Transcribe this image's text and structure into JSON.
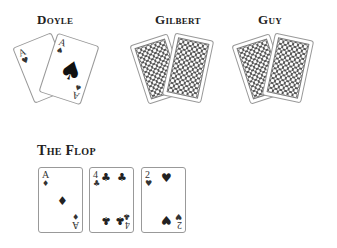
{
  "players": [
    {
      "name": "Doyle",
      "cards": [
        {
          "rank": "A",
          "suit": "♥",
          "face": "up"
        },
        {
          "rank": "A",
          "suit": "♠",
          "face": "up"
        }
      ]
    },
    {
      "name": "Gilbert",
      "cards": [
        {
          "face": "down"
        },
        {
          "face": "down"
        }
      ]
    },
    {
      "name": "Guy",
      "cards": [
        {
          "face": "down"
        },
        {
          "face": "down"
        }
      ]
    }
  ],
  "flop": {
    "title": "The Flop",
    "cards": [
      {
        "rank": "A",
        "suit": "♦"
      },
      {
        "rank": "4",
        "suit": "♣"
      },
      {
        "rank": "2",
        "suit": "♥"
      }
    ]
  }
}
